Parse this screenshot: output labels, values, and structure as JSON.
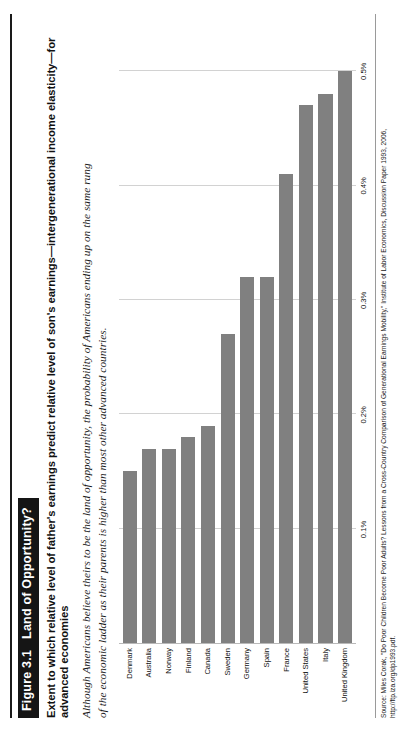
{
  "figure": {
    "tag": "Figure 3.1",
    "tag_title": "Land of Opportunity?",
    "title": "Extent to which relative level of father's earnings predict relative level of son's earnings—intergenerational income elasticity—for advanced economies",
    "subtitle": "Although Americans believe theirs to be the land of opportunity, the probability of Americans ending up on the same rung of the economic ladder as their parents is higher than most other advanced countries.",
    "source": "Source: Miles Corak, \"Do Poor Children Become Poor Adults? Lessons from a Cross-Country Comparison of Generational Earnings Mobility,\" Institute of Labor Economics, Discussion Paper 1993, 2006,",
    "source_url": "http://ftp.iza.org/dp1993.pdf."
  },
  "chart_data": {
    "type": "bar",
    "orientation": "horizontal",
    "title": "Extent to which relative level of father's earnings predict relative level of son's earnings—intergenerational income elasticity—for advanced economies",
    "xlabel": "",
    "ylabel": "",
    "xlim": [
      0,
      0.55
    ],
    "grid": true,
    "legend": false,
    "tick_labels": [
      "0.1%",
      "0.2%",
      "0.3%",
      "0.4%",
      "0.5%"
    ],
    "tick_values": [
      0.1,
      0.2,
      0.3,
      0.4,
      0.5
    ],
    "categories": [
      "Denmark",
      "Australia",
      "Norway",
      "Finland",
      "Canada",
      "Sweden",
      "Germany",
      "Spain",
      "France",
      "United States",
      "Italy",
      "United Kingdom"
    ],
    "values": [
      0.15,
      0.17,
      0.17,
      0.18,
      0.19,
      0.27,
      0.32,
      0.32,
      0.41,
      0.47,
      0.48,
      0.5
    ],
    "bar_color": "#808080",
    "gridline_color": "#d2d2d2"
  }
}
